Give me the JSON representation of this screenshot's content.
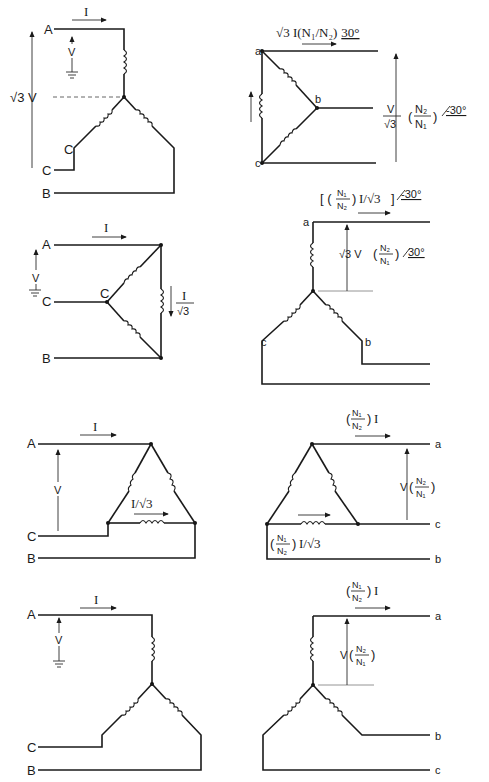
{
  "diagram": {
    "rows": [
      {
        "primary": {
          "type": "wye",
          "terminals": [
            "A",
            "C",
            "B"
          ],
          "winding_label": "C",
          "current": "I",
          "phase_voltage": "V",
          "line_voltage": "√3 V"
        },
        "secondary": {
          "type": "delta",
          "terminals": [
            "a",
            "b",
            "c"
          ],
          "current": "√3 I(N₁/N₂)",
          "current_angle": "30°",
          "voltage_num": "V",
          "voltage_den": "√3",
          "ratio_num": "N₂",
          "ratio_den": "N₁",
          "voltage_angle": "-30°"
        }
      },
      {
        "primary": {
          "type": "delta",
          "terminals": [
            "A",
            "C",
            "B"
          ],
          "node_label": "C",
          "current": "I",
          "voltage": "V",
          "winding_current_num": "I",
          "winding_current_den": "√3"
        },
        "secondary": {
          "type": "wye",
          "terminals": [
            "a",
            "c",
            "b"
          ],
          "current_ratio_num": "N₁",
          "current_ratio_den": "N₂",
          "current_suffix": "I/√3",
          "current_angle": "-30°",
          "voltage_prefix": "√3 V",
          "ratio_num": "N₂",
          "ratio_den": "N₁",
          "voltage_angle": "30°"
        }
      },
      {
        "primary": {
          "type": "delta",
          "terminals": [
            "A",
            "C",
            "B"
          ],
          "current": "I",
          "voltage": "V",
          "winding_current": "I/√3"
        },
        "secondary": {
          "type": "delta",
          "terminals": [
            "a",
            "c",
            "b"
          ],
          "current_ratio_num": "N₁",
          "current_ratio_den": "N₂",
          "current_suffix": "I",
          "voltage_prefix": "V",
          "ratio_num": "N₂",
          "ratio_den": "N₁",
          "winding_ratio_num": "N₁",
          "winding_ratio_den": "N₂",
          "winding_suffix": "I/√3"
        }
      },
      {
        "primary": {
          "type": "wye",
          "terminals": [
            "A",
            "C",
            "B"
          ],
          "current": "I",
          "voltage": "V"
        },
        "secondary": {
          "type": "wye",
          "terminals": [
            "a",
            "b",
            "c"
          ],
          "current_ratio_num": "N₁",
          "current_ratio_den": "N₂",
          "current_suffix": "I",
          "voltage_prefix": "V",
          "ratio_num": "N₂",
          "ratio_den": "N₁"
        }
      }
    ]
  }
}
